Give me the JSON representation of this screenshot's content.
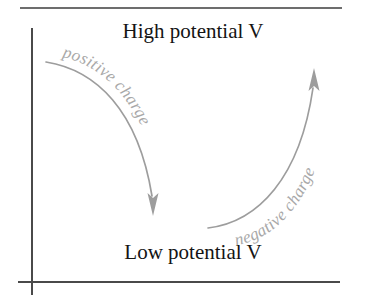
{
  "figure": {
    "name": "potential-charge-flow-diagram",
    "background_color": "#ffffff",
    "labels": {
      "high_potential": "High potential V",
      "low_potential": "Low potential V",
      "positive_charge": "positive charge",
      "negative_charge": "negative charge"
    },
    "colors": {
      "text_dark": "#141414",
      "curve_gray": "#9d9d9d",
      "label_gray": "#a8a8a8",
      "axis_dark": "#4a4a4a",
      "rule_dark": "#3c3c3c"
    },
    "axes": {
      "vertical_x": 32,
      "vertical_top_y": 28,
      "vertical_bottom_y": 295,
      "horizontal_y": 282,
      "horizontal_left_x": 18,
      "horizontal_right_x": 340,
      "top_rule_y": 8,
      "top_rule_left_x": 20,
      "top_rule_right_x": 342
    },
    "flows": [
      {
        "name": "positive-charge-flow",
        "direction": "downward",
        "from": "high potential",
        "to": "low potential",
        "curve": "M 46 62 C 96 70, 138 110, 152 196",
        "arrow_tip_x": 153,
        "arrow_tip_y": 216,
        "label": "positive charge"
      },
      {
        "name": "negative-charge-flow",
        "direction": "upward",
        "from": "low potential",
        "to": "high potential",
        "curve": "M 208 228 C 258 222, 300 178, 313 88",
        "arrow_tip_x": 314,
        "arrow_tip_y": 68,
        "label": "negative charge"
      }
    ],
    "text_positions": {
      "high_potential_x": 193,
      "high_potential_y": 38,
      "low_potential_x": 193,
      "low_potential_y": 259
    }
  }
}
